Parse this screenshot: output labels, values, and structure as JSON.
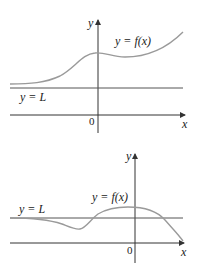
{
  "graphs": [
    {
      "id": "top",
      "y_axis_label": "y",
      "x_axis_label": "x",
      "origin_label": "0",
      "curve_label": "y = f(x)",
      "asymptote_label": "y = L",
      "colors": {
        "axis": "#333333",
        "asymptote": "#555555",
        "curve": "#9a9a9a"
      }
    },
    {
      "id": "bottom",
      "y_axis_label": "y",
      "x_axis_label": "x",
      "origin_label": "0",
      "curve_label": "y = f(x)",
      "asymptote_label": "y = L",
      "colors": {
        "axis": "#333333",
        "asymptote": "#555555",
        "curve": "#9a9a9a"
      }
    }
  ]
}
